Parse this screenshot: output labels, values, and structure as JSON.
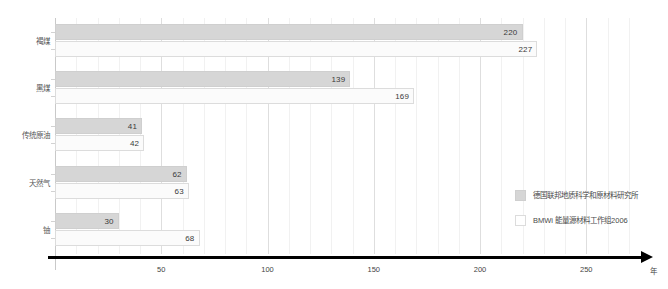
{
  "chart_data": {
    "type": "bar",
    "orientation": "horizontal",
    "title": "",
    "xlabel": "年",
    "ylabel": "",
    "categories": [
      "褐煤",
      "黑煤",
      "传统原油",
      "天然气",
      "铀"
    ],
    "series": [
      {
        "name": "德国联邦地质科学和原材料研究所",
        "color": "#d6d6d6",
        "values": [
          220,
          139,
          41,
          62,
          30
        ]
      },
      {
        "name": "BMWi 能量源材料工作组2006",
        "color": "#ffffff",
        "values": [
          227,
          169,
          42,
          63,
          68
        ]
      }
    ],
    "xlim": [
      0,
      280
    ],
    "xticks": [
      50,
      100,
      150,
      200,
      250
    ],
    "xtick_labels": [
      "50",
      "100",
      "150",
      "200",
      "250"
    ],
    "minor_tick_step": 10,
    "grid": true,
    "legend_position": "right"
  },
  "legend": {
    "items": [
      {
        "label": "德国联邦地质科学和原材料研究所"
      },
      {
        "label": "BMWi 能量源材料工作组2006"
      }
    ]
  },
  "axis": {
    "unit_label": "年"
  }
}
